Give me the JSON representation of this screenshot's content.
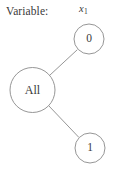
{
  "diagram": {
    "kind": "decision-tree-split",
    "background_color": "#ffffff",
    "stroke_color": "#8a8a8a",
    "text_color": "#3a3a3a",
    "caption": {
      "label": "Variable:"
    },
    "variable": {
      "base": "x",
      "subscript": "1",
      "full": "x1"
    },
    "nodes": [
      {
        "id": "all",
        "label": "All",
        "cx": 32.5,
        "cy": 90,
        "r": 22.5,
        "role": "root"
      },
      {
        "id": "branch-zero",
        "label": "0",
        "cx": 89,
        "cy": 39,
        "r": 15,
        "role": "child"
      },
      {
        "id": "branch-one",
        "label": "1",
        "cx": 90,
        "cy": 148,
        "r": 15,
        "role": "child"
      }
    ],
    "edges": [
      {
        "id": "edge-all-to-zero",
        "from": "all",
        "to": "branch-zero",
        "x1": 49.5,
        "y1": 75.5,
        "x2": 77,
        "y2": 50
      },
      {
        "id": "edge-all-to-one",
        "from": "all",
        "to": "branch-one",
        "x1": 48.5,
        "y1": 105.5,
        "x2": 78.5,
        "y2": 137
      }
    ]
  }
}
